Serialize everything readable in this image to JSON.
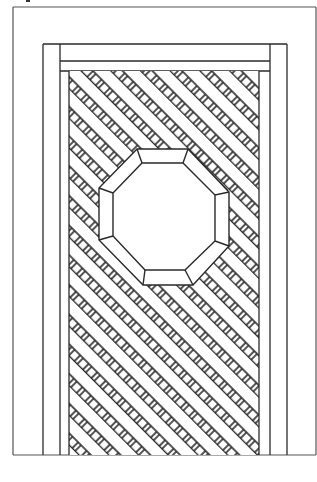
{
  "figure": {
    "label": "",
    "colors": {
      "line": "#2a2a2a",
      "frame_line": "#333333",
      "fill": "#ffffff"
    },
    "outer_border": {
      "x1": 13,
      "y1": 7,
      "x2": 316,
      "y2": 455
    },
    "frame": {
      "x1": 43,
      "y1": 44,
      "x2": 287,
      "y2": 455
    },
    "stiles": {
      "left_x": 60,
      "right_x": 270
    },
    "top_rail": {
      "y_top": 61,
      "y_bottom": 71
    },
    "lattice_area": {
      "x1": 69,
      "y1": 71,
      "x2": 259,
      "y2": 455,
      "period": 21,
      "hole_size": 8,
      "hole_spacing": 12
    },
    "octagon_outer": "137,149 188,149 229,192 229,246 193,285 143,285 99,240 99,188",
    "octagon_inner": "142,163 183,163 215,195 215,241 185,270 145,270 113,236 113,193"
  }
}
